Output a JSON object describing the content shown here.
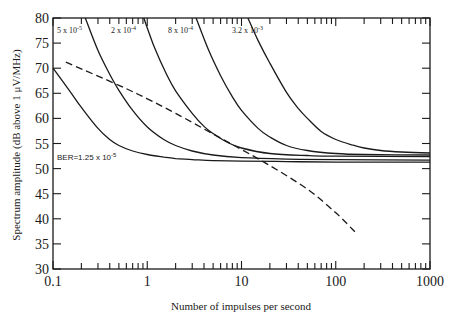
{
  "chart_data": {
    "type": "line",
    "title": "",
    "xlabel": "Number of impulses per second",
    "ylabel": "Spectrum amplitude (dB above 1 μV/MHz)",
    "xscale": "log",
    "xlim": [
      0.1,
      1000
    ],
    "ylim": [
      30,
      80
    ],
    "x_ticks": [
      0.1,
      1,
      10,
      100,
      1000
    ],
    "x_tick_labels": [
      "0.1",
      "1",
      "10",
      "100",
      "1000"
    ],
    "y_ticks": [
      30,
      35,
      40,
      45,
      50,
      55,
      60,
      65,
      70,
      75,
      80
    ],
    "y_tick_labels": [
      "30",
      "35",
      "40",
      "45",
      "50",
      "55",
      "60",
      "65",
      "70",
      "75",
      "80"
    ],
    "grid": false,
    "legend": "inline annotations",
    "series": [
      {
        "name": "BER=1.25 x 10^-5",
        "label": "BER=1.25 x 10",
        "label_exp": "-5",
        "style": "solid",
        "x": [
          0.1,
          0.15,
          0.2,
          0.3,
          0.4,
          0.5,
          0.7,
          1,
          1.5,
          2,
          3,
          5,
          10,
          30,
          100,
          1000
        ],
        "y": [
          70,
          65.5,
          62.2,
          58,
          55.8,
          54.6,
          53.5,
          52.8,
          52.3,
          52.0,
          51.8,
          51.6,
          51.5,
          51.4,
          51.3,
          51.3
        ]
      },
      {
        "name": "5 x 10^-5",
        "label": "5 x 10",
        "label_exp": "-5",
        "style": "solid",
        "x": [
          0.22,
          0.3,
          0.4,
          0.5,
          0.7,
          1,
          1.5,
          2,
          3,
          5,
          10,
          30,
          100,
          1000
        ],
        "y": [
          80,
          73.5,
          68.8,
          65.6,
          61.6,
          58.3,
          55.8,
          54.6,
          53.5,
          52.7,
          52.2,
          51.9,
          51.8,
          51.7
        ]
      },
      {
        "name": "2 x 10^-4",
        "label": "2 x 10",
        "label_exp": "-4",
        "style": "solid",
        "x": [
          0.92,
          1.2,
          1.6,
          2,
          3,
          4,
          5,
          7,
          10,
          20,
          50,
          100,
          1000
        ],
        "y": [
          80,
          74,
          68.8,
          65.5,
          61,
          58.4,
          57.0,
          55.3,
          54.1,
          53.0,
          52.6,
          52.5,
          52.4
        ]
      },
      {
        "name": "8 x 10^-4",
        "label": "8 x 10",
        "label_exp": "-4",
        "style": "solid",
        "x": [
          3.3,
          4.5,
          6,
          8,
          10,
          15,
          20,
          30,
          50,
          100,
          200,
          1000
        ],
        "y": [
          80,
          73.5,
          68.5,
          64.3,
          61.6,
          58.0,
          56.3,
          54.6,
          53.6,
          53.0,
          52.8,
          52.7
        ]
      },
      {
        "name": "3.2 x 10^-3",
        "label": "3.2 x 10",
        "label_exp": "-3",
        "style": "solid",
        "x": [
          11.7,
          15,
          20,
          30,
          40,
          50,
          70,
          100,
          150,
          200,
          300,
          500,
          1000
        ],
        "y": [
          80,
          75.5,
          71,
          65.2,
          62,
          60,
          57.4,
          55.8,
          54.7,
          54.1,
          53.6,
          53.3,
          53.1
        ]
      },
      {
        "name": "reference (dashed)",
        "style": "dashed",
        "x": [
          0.137,
          0.5,
          1,
          2,
          5,
          10,
          20,
          50,
          100,
          160
        ],
        "y": [
          71.2,
          66.6,
          63.9,
          61.0,
          56.9,
          53.8,
          50.6,
          45.9,
          41.2,
          37.4
        ]
      }
    ]
  }
}
